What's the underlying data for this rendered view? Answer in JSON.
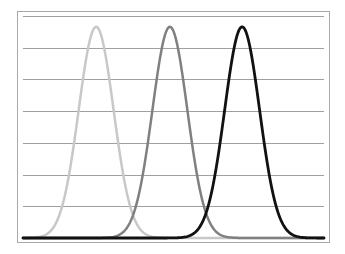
{
  "chart_data": {
    "type": "line",
    "title": "",
    "xlabel": "",
    "ylabel": "",
    "xlim": [
      0,
      100
    ],
    "ylim": [
      0,
      7
    ],
    "grid": {
      "horizontal": true,
      "vertical": false,
      "y_ticks": [
        0,
        1,
        2,
        3,
        4,
        5,
        6,
        7
      ]
    },
    "legend": null,
    "x_tick_labels": [],
    "y_tick_labels": [],
    "series": [
      {
        "name": "curve-1",
        "shape": "gaussian",
        "mean": 24.3,
        "sigma": 5.8,
        "peak": 6.66,
        "color": "#c8c8c8",
        "width": 2.5
      },
      {
        "name": "curve-2",
        "shape": "gaussian",
        "mean": 48.8,
        "sigma": 5.8,
        "peak": 6.66,
        "color": "#808080",
        "width": 2.5
      },
      {
        "name": "curve-3",
        "shape": "gaussian",
        "mean": 72.8,
        "sigma": 5.8,
        "peak": 6.66,
        "color": "#111111",
        "width": 2.8
      }
    ],
    "x": [
      0,
      10,
      15,
      20,
      24.3,
      30,
      35,
      40,
      45,
      48.8,
      55,
      60,
      65,
      72.8,
      80,
      85,
      90,
      100
    ],
    "sampled_values": {
      "curve-1": [
        0.0,
        0.54,
        2.5,
        5.5,
        6.66,
        4.91,
        1.24,
        0.09,
        0.0,
        0.0,
        0.0,
        0.0,
        0.0,
        0.0,
        0.0,
        0.0,
        0.0,
        0.0
      ],
      "curve-2": [
        0.0,
        0.0,
        0.0,
        0.0,
        0.0,
        0.03,
        0.44,
        2.1,
        5.0,
        6.66,
        3.7,
        1.03,
        0.12,
        0.0,
        0.0,
        0.0,
        0.0,
        0.0
      ],
      "curve-3": [
        0.0,
        0.0,
        0.0,
        0.0,
        0.0,
        0.0,
        0.0,
        0.0,
        0.0,
        0.0,
        0.15,
        0.64,
        2.66,
        6.66,
        3.05,
        0.72,
        0.08,
        0.0
      ]
    }
  },
  "style": {
    "frame_color": "#a8a8a8",
    "grid_color": "#a0a0a0",
    "background": "#ffffff"
  }
}
